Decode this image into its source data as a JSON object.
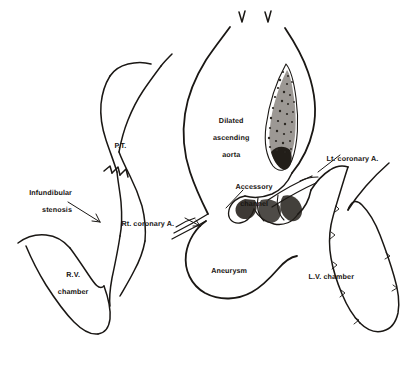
{
  "figure": {
    "type": "anatomical-line-drawing",
    "ink_color": "#1a1714",
    "background_color": "#ffffff",
    "width": 405,
    "height": 375
  },
  "labels": {
    "pulmonary_trunk": "P.T.",
    "infundibular_stenosis_line1": "Infundibular",
    "infundibular_stenosis_line2": "stenosis",
    "rv_chamber_line1": "R.V.",
    "rv_chamber_line2": "chamber",
    "rt_coronary": "Rt. coronary A.",
    "dilated_aorta_line1": "Dilated",
    "dilated_aorta_line2": "ascending",
    "dilated_aorta_line3": "aorta",
    "accessory_channel_line1": "Accessory",
    "accessory_channel_line2": "channel",
    "lt_coronary": "Lt. coronary A.",
    "aneurysm": "Aneurysm",
    "lv_chamber": "L.V. chamber"
  },
  "structures": [
    {
      "name": "pulmonary-trunk",
      "label": "P.T."
    },
    {
      "name": "infundibular-stenosis",
      "label": "Infundibular stenosis"
    },
    {
      "name": "right-ventricle-chamber",
      "label": "R.V. chamber"
    },
    {
      "name": "right-coronary-artery",
      "label": "Rt. coronary A."
    },
    {
      "name": "dilated-ascending-aorta",
      "label": "Dilated ascending aorta"
    },
    {
      "name": "accessory-channel",
      "label": "Accessory channel"
    },
    {
      "name": "left-coronary-artery",
      "label": "Lt. coronary A."
    },
    {
      "name": "aortic-root-aneurysm",
      "label": "Aneurysm"
    },
    {
      "name": "left-ventricle-chamber",
      "label": "L.V. chamber"
    }
  ]
}
